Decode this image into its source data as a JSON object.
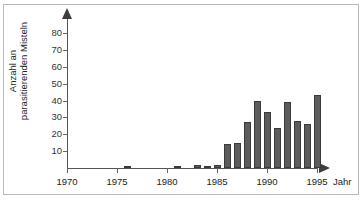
{
  "chart_data": {
    "type": "bar",
    "title": "",
    "xlabel": "Jahr",
    "ylabel": "Anzahl an\nparasitierenden Misteln",
    "grid": false,
    "legend": null,
    "xlim": [
      1969,
      1996
    ],
    "ylim": [
      0,
      88
    ],
    "ytick_labels": [
      "10",
      "20",
      "30",
      "40",
      "50",
      "60",
      "70",
      "80"
    ],
    "ytick_values": [
      10,
      20,
      30,
      40,
      50,
      60,
      70,
      80
    ],
    "xtick_labels": [
      "1970",
      "1975",
      "1980",
      "1985",
      "1990",
      "1995"
    ],
    "xtick_values": [
      1970,
      1975,
      1980,
      1985,
      1990,
      1995
    ],
    "categories": [
      1970,
      1971,
      1972,
      1973,
      1974,
      1975,
      1976,
      1977,
      1978,
      1979,
      1980,
      1981,
      1982,
      1983,
      1984,
      1985,
      1986,
      1987,
      1988,
      1989,
      1990,
      1991,
      1992,
      1993,
      1994,
      1995
    ],
    "values": [
      0,
      0,
      0,
      0,
      0,
      0,
      1,
      0,
      0,
      0,
      0,
      1,
      0,
      2,
      1,
      2,
      14,
      15,
      27,
      40,
      33,
      24,
      39,
      28,
      26,
      43
    ],
    "bar_color": "#5c5c5c",
    "bar_edge_color": "#3a3a3a",
    "background_color": "#ffffff",
    "axis_color": "#555555"
  }
}
